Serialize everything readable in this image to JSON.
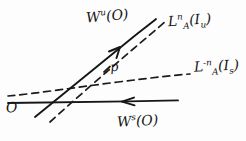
{
  "figure": {
    "background_color": "#fdfdfd",
    "ink_color": "#161616",
    "labels": {
      "unstable_manifold": {
        "base": "W",
        "sup": "u",
        "arg": "(O)"
      },
      "stable_manifold": {
        "base": "W",
        "sup": "s",
        "arg": "(O)"
      },
      "image_unstable": {
        "base": "L",
        "sub": "A",
        "sup": "n",
        "arg_open": "(",
        "arg_base": "I",
        "arg_sub": "u",
        "arg_close": ")"
      },
      "image_stable": {
        "base": "L",
        "sub": "A",
        "sup": "-n",
        "arg_open": "(",
        "arg_base": "I",
        "arg_sub": "s",
        "arg_close": ")"
      },
      "intersection_point": "p",
      "fixed_point": "O"
    },
    "strokes": [
      {
        "name": "unstable-manifold-line",
        "style": "solid",
        "role": "W^u(O)"
      },
      {
        "name": "stable-manifold-line",
        "style": "solid",
        "role": "W^s(O)"
      },
      {
        "name": "image-unstable-line",
        "style": "dashed",
        "role": "L_A^n(I_u)"
      },
      {
        "name": "image-stable-line",
        "style": "dashed",
        "role": "L_A^-n(I_s)"
      }
    ],
    "arrows": [
      {
        "name": "unstable-direction-arrow",
        "direction": "up-right"
      },
      {
        "name": "stable-direction-arrow",
        "direction": "left"
      }
    ]
  }
}
